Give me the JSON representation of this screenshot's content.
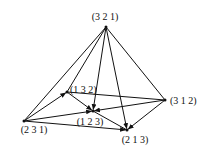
{
  "diagram": {
    "type": "directed-graph",
    "nodes": [
      {
        "id": "321",
        "label": "(3  2  1)",
        "x": 106,
        "y": 27,
        "lx": 105,
        "ly": 20,
        "anchor": "middle"
      },
      {
        "id": "132",
        "label": "(1  3  2)",
        "x": 67,
        "y": 92,
        "lx": 70,
        "ly": 93,
        "anchor": "start"
      },
      {
        "id": "312",
        "label": "(3  1  2)",
        "x": 165,
        "y": 100,
        "lx": 170,
        "ly": 104,
        "anchor": "start"
      },
      {
        "id": "231",
        "label": "(2  3  1)",
        "x": 24,
        "y": 121,
        "lx": 34,
        "ly": 133,
        "anchor": "middle"
      },
      {
        "id": "123",
        "label": "(1  2  3)",
        "x": 93,
        "y": 111,
        "lx": 90,
        "ly": 125,
        "anchor": "middle"
      },
      {
        "id": "213",
        "label": "(2  1  3)",
        "x": 127,
        "y": 130,
        "lx": 135,
        "ly": 143,
        "anchor": "middle"
      }
    ],
    "edges": [
      {
        "from": "321",
        "to": "231",
        "arrow": false
      },
      {
        "from": "321",
        "to": "132",
        "arrow": false
      },
      {
        "from": "321",
        "to": "123",
        "arrow": true
      },
      {
        "from": "321",
        "to": "213",
        "arrow": true
      },
      {
        "from": "321",
        "to": "312",
        "arrow": false
      },
      {
        "from": "231",
        "to": "132",
        "arrow": true
      },
      {
        "from": "231",
        "to": "123",
        "arrow": true
      },
      {
        "from": "231",
        "to": "213",
        "arrow": true
      },
      {
        "from": "132",
        "to": "123",
        "arrow": true
      },
      {
        "from": "132",
        "to": "312",
        "arrow": false
      },
      {
        "from": "312",
        "to": "123",
        "arrow": true
      },
      {
        "from": "312",
        "to": "213",
        "arrow": true
      },
      {
        "from": "123",
        "to": "213",
        "arrow": false
      }
    ]
  }
}
